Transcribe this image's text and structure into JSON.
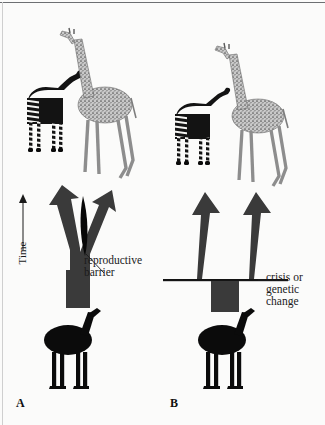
{
  "figure": {
    "background_color": "#fbfbfa",
    "ink_color": "#1a1a1a"
  },
  "axis": {
    "time_label": "Time",
    "time_direction": "upward",
    "arrow_icon": "up-arrow-icon"
  },
  "panels": [
    {
      "id": "A",
      "letter": "A",
      "model": "gradual divergence behind a reproductive barrier",
      "annotation": "reproductive\nbarrier",
      "annotation_lines": [
        "reproductive",
        "barrier"
      ],
      "leader_line": "diagonal",
      "arrow_shape": "Y-split",
      "barrier_shape": "black lens wedge in fork",
      "descendants": [
        "okapi",
        "giraffe"
      ],
      "ancestor": "ancestral giraffe silhouette"
    },
    {
      "id": "B",
      "letter": "B",
      "model": "abrupt split following a crisis or genetic change",
      "annotation": "crisis or\ngenetic\nchange",
      "annotation_lines": [
        "crisis or",
        "genetic",
        "change"
      ],
      "leader_line": "horizontal",
      "arrow_shape": "two separate tapered arrows on a horizontal bar",
      "barrier_shape": "horizontal rule with rectangular stem below",
      "descendants": [
        "okapi",
        "giraffe"
      ],
      "ancestor": "ancestral giraffe silhouette"
    }
  ],
  "animals": {
    "okapi": {
      "name": "okapi",
      "fill": "#111111",
      "markings": "white leg and rump stripes"
    },
    "giraffe": {
      "name": "giraffe",
      "fill": "#b9b9b9",
      "markings": "stippled spotted coat"
    },
    "ancestor": {
      "name": "ancestral giraffe",
      "fill": "#0b0b0b",
      "markings": "solid silhouette"
    }
  },
  "colors": {
    "arrow": "#3a3a3a",
    "rule": "#6d6f72",
    "text": "#1a1a1a"
  }
}
